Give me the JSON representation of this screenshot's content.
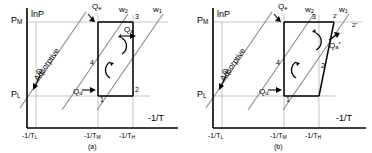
{
  "figure": {
    "type": "clapeyron-diagram-pair",
    "axis": {
      "y_label": "lnP",
      "x_label": "-1/T",
      "y_ticks": [
        "P",
        "P"
      ],
      "y_tick_subs": [
        "M",
        "L"
      ],
      "x_ticks": [
        "-1/T",
        "-1/T",
        "-1/T"
      ],
      "x_tick_subs": [
        "L",
        "M",
        "H"
      ]
    },
    "panels": [
      {
        "caption": "(a)",
        "y_axis_label": "lnP",
        "x_axis_label": "-1/T",
        "pressure_labels": [
          {
            "base": "P",
            "sub": "M"
          },
          {
            "base": "P",
            "sub": "L"
          }
        ],
        "temperature_labels": [
          {
            "base": "-1/T",
            "sub": "L"
          },
          {
            "base": "-1/T",
            "sub": "M"
          },
          {
            "base": "-1/T",
            "sub": "H"
          }
        ],
        "adsorptive_label": "Adsorptive",
        "isostere_labels": [
          {
            "base": "w",
            "sub": "2"
          },
          {
            "base": "w",
            "sub": "1"
          }
        ],
        "heat_labels": [
          {
            "base": "Q",
            "sub": "e",
            "sup": ""
          },
          {
            "base": "Q",
            "sub": "c",
            "sup": ""
          },
          {
            "base": "Q",
            "sub": "d",
            "sup": ""
          },
          {
            "base": "Q",
            "sub": "a",
            "sup": ""
          }
        ],
        "state_points": [
          "1",
          "2",
          "3",
          "4"
        ]
      },
      {
        "caption": "(b)",
        "y_axis_label": "lnP",
        "x_axis_label": "-1/T",
        "pressure_labels": [
          {
            "base": "P",
            "sub": "M"
          },
          {
            "base": "P",
            "sub": "L"
          }
        ],
        "temperature_labels": [
          {
            "base": "-1/T",
            "sub": "L"
          },
          {
            "base": "-1/T",
            "sub": "M"
          },
          {
            "base": "-1/T",
            "sub": "H"
          }
        ],
        "adsorptive_label": "Adsorptive",
        "isostere_labels": [
          {
            "base": "w",
            "sub": "2"
          },
          {
            "base": "w",
            "sub": "1"
          }
        ],
        "heat_labels": [
          {
            "base": "Q",
            "sub": "e",
            "sup": ""
          },
          {
            "base": "Q",
            "sub": "c",
            "sup": ""
          },
          {
            "base": "Q",
            "sub": "d",
            "sup": ""
          },
          {
            "base": "Q",
            "sub": "a",
            "sup": "*"
          }
        ],
        "state_points": [
          "1",
          "2",
          "2'",
          "2\"",
          "3",
          "4"
        ]
      }
    ],
    "colors": {
      "axis": "#000000",
      "cycle": "#000000",
      "isostere": "#808080",
      "guide": "#b0b0b0",
      "background": "#ffffff"
    }
  }
}
